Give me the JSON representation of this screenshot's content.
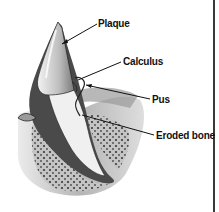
{
  "diagram": {
    "labels": [
      {
        "id": "plaque",
        "text": "Plaque"
      },
      {
        "id": "calculus",
        "text": "Calculus"
      },
      {
        "id": "pus",
        "text": "Pus"
      },
      {
        "id": "eroded_bone",
        "text": "Eroded bone"
      }
    ],
    "colors": {
      "ink": "#111111",
      "enamel": "#cfcfcf",
      "dentin": "#f2f2f2",
      "gum_dark": "#5a5a5a",
      "bone": "#bdbdbd"
    }
  }
}
